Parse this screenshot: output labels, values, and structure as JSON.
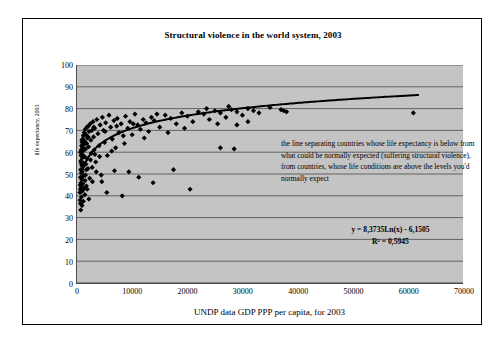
{
  "chart_data": {
    "type": "scatter",
    "title": "Structural violence in the world system, 2003",
    "xlabel": "UNDP data GDP PPP per capita, for 2003",
    "ylabel": "life expectancy, 2003",
    "xlim": [
      0,
      70000
    ],
    "ylim": [
      0,
      100
    ],
    "xticks": [
      0,
      10000,
      20000,
      30000,
      40000,
      50000,
      60000,
      70000
    ],
    "yticks": [
      0,
      10,
      20,
      30,
      40,
      50,
      60,
      70,
      80,
      90,
      100
    ],
    "grid": "horizontal",
    "legend": "none",
    "plot_background": "#c4c4c4",
    "marker_color": "#000000",
    "marker_shape": "diamond",
    "trendline": {
      "kind": "logarithmic",
      "slope": 8.3735,
      "intercept": -6.1505,
      "r_squared": 0.5945,
      "color": "#000000",
      "x_start": 900,
      "x_end": 62000
    },
    "annotations": [
      {
        "name": "note",
        "text": "the line separating countries whose life expectancy is below from what could be normally expected (suffering structural violence), from countries, whose life conditions are above the levels you'd normally expect"
      },
      {
        "name": "equation",
        "text": "y = 8,3735Ln(x) - 6,1505"
      },
      {
        "name": "r-squared",
        "text": "R² = 0,5945"
      }
    ],
    "points": [
      [
        520,
        41.5
      ],
      [
        560,
        38.0
      ],
      [
        580,
        45.0
      ],
      [
        600,
        43.0
      ],
      [
        620,
        48.5
      ],
      [
        640,
        36.5
      ],
      [
        660,
        52.0
      ],
      [
        680,
        33.5
      ],
      [
        700,
        56.0
      ],
      [
        710,
        46.0
      ],
      [
        730,
        58.5
      ],
      [
        750,
        44.0
      ],
      [
        770,
        61.0
      ],
      [
        790,
        50.5
      ],
      [
        810,
        39.5
      ],
      [
        830,
        63.0
      ],
      [
        850,
        54.0
      ],
      [
        870,
        47.5
      ],
      [
        890,
        42.0
      ],
      [
        910,
        59.0
      ],
      [
        930,
        64.5
      ],
      [
        950,
        51.0
      ],
      [
        980,
        57.5
      ],
      [
        1000,
        62.0
      ],
      [
        1020,
        45.5
      ],
      [
        1050,
        66.0
      ],
      [
        1080,
        53.5
      ],
      [
        1100,
        60.5
      ],
      [
        1130,
        49.0
      ],
      [
        1160,
        67.5
      ],
      [
        1200,
        55.0
      ],
      [
        1240,
        63.5
      ],
      [
        1280,
        43.5
      ],
      [
        1320,
        69.0
      ],
      [
        1360,
        58.0
      ],
      [
        1400,
        65.0
      ],
      [
        1450,
        47.0
      ],
      [
        1500,
        70.5
      ],
      [
        1550,
        61.5
      ],
      [
        1600,
        54.5
      ],
      [
        1650,
        68.0
      ],
      [
        1700,
        44.5
      ],
      [
        1750,
        64.0
      ],
      [
        1800,
        71.5
      ],
      [
        1850,
        57.0
      ],
      [
        1900,
        66.5
      ],
      [
        1980,
        52.5
      ],
      [
        2050,
        72.0
      ],
      [
        2100,
        62.5
      ],
      [
        2200,
        69.5
      ],
      [
        2300,
        48.0
      ],
      [
        2400,
        73.0
      ],
      [
        2500,
        65.5
      ],
      [
        2600,
        59.5
      ],
      [
        2700,
        70.0
      ],
      [
        2800,
        46.5
      ],
      [
        2900,
        74.0
      ],
      [
        3000,
        67.0
      ],
      [
        3100,
        61.0
      ],
      [
        3200,
        71.0
      ],
      [
        3400,
        55.5
      ],
      [
        3600,
        75.0
      ],
      [
        3800,
        68.5
      ],
      [
        4000,
        63.0
      ],
      [
        4200,
        72.5
      ],
      [
        4400,
        49.5
      ],
      [
        4600,
        76.0
      ],
      [
        4800,
        70.0
      ],
      [
        5000,
        64.5
      ],
      [
        5200,
        73.5
      ],
      [
        5500,
        58.5
      ],
      [
        5800,
        77.0
      ],
      [
        6100,
        71.5
      ],
      [
        6400,
        66.0
      ],
      [
        6700,
        74.5
      ],
      [
        7000,
        62.0
      ],
      [
        7300,
        75.5
      ],
      [
        7600,
        69.0
      ],
      [
        8000,
        73.0
      ],
      [
        8400,
        67.5
      ],
      [
        8800,
        76.5
      ],
      [
        9200,
        71.0
      ],
      [
        9600,
        74.0
      ],
      [
        10000,
        68.0
      ],
      [
        10500,
        77.5
      ],
      [
        11000,
        72.5
      ],
      [
        11500,
        70.5
      ],
      [
        12000,
        75.0
      ],
      [
        12500,
        73.5
      ],
      [
        13000,
        69.5
      ],
      [
        13500,
        76.0
      ],
      [
        14000,
        74.5
      ],
      [
        15000,
        71.5
      ],
      [
        16000,
        77.0
      ],
      [
        17000,
        75.5
      ],
      [
        18000,
        73.0
      ],
      [
        19000,
        78.0
      ],
      [
        20000,
        76.5
      ],
      [
        21000,
        74.0
      ],
      [
        22000,
        78.5
      ],
      [
        23000,
        77.5
      ],
      [
        24000,
        75.0
      ],
      [
        25000,
        79.0
      ],
      [
        26000,
        78.0
      ],
      [
        27000,
        76.0
      ],
      [
        28000,
        79.5
      ],
      [
        29000,
        78.5
      ],
      [
        30000,
        77.0
      ],
      [
        31000,
        80.0
      ],
      [
        32000,
        79.0
      ],
      [
        33000,
        78.0
      ],
      [
        35000,
        80.5
      ],
      [
        37000,
        79.5
      ],
      [
        38000,
        78.5
      ],
      [
        3500,
        51.0
      ],
      [
        4500,
        46.5
      ],
      [
        5400,
        41.5
      ],
      [
        6800,
        51.5
      ],
      [
        8200,
        40.0
      ],
      [
        9400,
        51.0
      ],
      [
        11200,
        48.5
      ],
      [
        13800,
        46.0
      ],
      [
        17500,
        52.0
      ],
      [
        20500,
        43.0
      ],
      [
        26000,
        62.0
      ],
      [
        28500,
        61.5
      ],
      [
        29000,
        72.5
      ],
      [
        31000,
        74.0
      ],
      [
        37500,
        79.0
      ],
      [
        61000,
        78.0
      ],
      [
        900,
        35.5
      ],
      [
        1150,
        37.5
      ],
      [
        1420,
        40.5
      ],
      [
        2150,
        38.5
      ],
      [
        2750,
        53.0
      ],
      [
        3250,
        59.0
      ],
      [
        1550,
        49.5
      ],
      [
        1850,
        43.0
      ],
      [
        760,
        55.0
      ],
      [
        640,
        60.0
      ],
      [
        880,
        65.5
      ],
      [
        1030,
        42.5
      ],
      [
        1280,
        68.0
      ],
      [
        1700,
        52.0
      ],
      [
        2000,
        67.0
      ],
      [
        2450,
        56.5
      ],
      [
        3050,
        71.5
      ],
      [
        4100,
        58.0
      ],
      [
        5100,
        69.5
      ],
      [
        6300,
        60.5
      ],
      [
        7200,
        72.0
      ],
      [
        8600,
        64.0
      ],
      [
        10200,
        73.0
      ],
      [
        12200,
        66.5
      ],
      [
        14500,
        77.5
      ],
      [
        16500,
        69.0
      ],
      [
        19500,
        71.0
      ],
      [
        23500,
        80.0
      ],
      [
        25500,
        73.0
      ],
      [
        27500,
        81.0
      ]
    ]
  }
}
